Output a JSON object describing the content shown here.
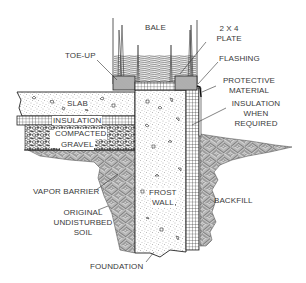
{
  "diagram": {
    "type": "construction-cross-section",
    "colors": {
      "line": "#222222",
      "fill_stipple": "#9a9a9a",
      "background": "#ffffff",
      "text": "#3a3a3a"
    },
    "labels": {
      "bale": "BALE",
      "plate_l1": "2 X 4",
      "plate_l2": "PLATE",
      "flashing": "FLASHING",
      "protective_l1": "PROTECTIVE",
      "protective_l2": "MATERIAL",
      "insulation_when_l1": "INSULATION",
      "insulation_when_l2": "WHEN",
      "insulation_when_l3": "REQUIRED",
      "toe_up": "TOE-UP",
      "slab": "SLAB",
      "insulation": "INSULATION",
      "compacted": "COMPACTED",
      "gravel": "GRAVEL",
      "vapor_barrier": "VAPOR BARRIER",
      "original_l1": "ORIGINAL",
      "original_l2": "UNDISTURBED",
      "original_l3": "SOIL",
      "frost_l1": "FROST",
      "frost_l2": "WALL",
      "backfill": "BACKFILL",
      "foundation": "FOUNDATION"
    }
  }
}
